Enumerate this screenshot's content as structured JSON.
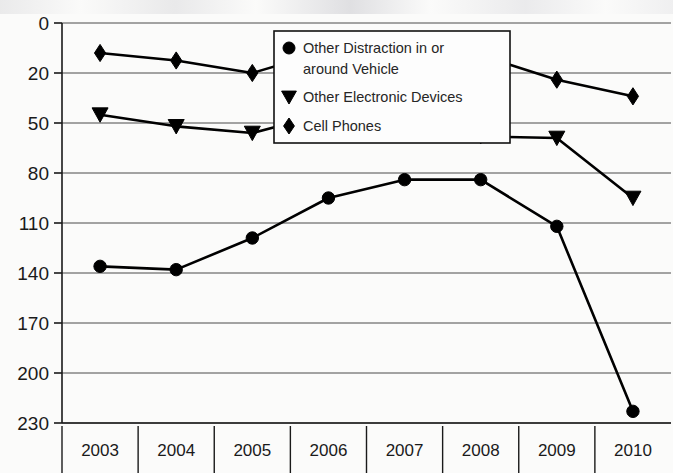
{
  "chart_data": {
    "type": "line",
    "title": "",
    "xlabel": "",
    "ylabel": "",
    "categories": [
      "2003",
      "2004",
      "2005",
      "2006",
      "2007",
      "2008",
      "2009",
      "2010"
    ],
    "ylim": [
      0,
      230
    ],
    "yticks": [
      0,
      20,
      50,
      80,
      110,
      140,
      170,
      200,
      230
    ],
    "ytick_labels": [
      "0",
      "20",
      "50",
      "80",
      "110",
      "140",
      "170",
      "200",
      "230"
    ],
    "grid": true,
    "legend_position": "upper-center",
    "series": [
      {
        "name": "Other Distraction in or around Vehicle",
        "marker": "circle",
        "values": [
          136,
          138,
          119,
          95,
          84,
          84,
          112,
          223
        ]
      },
      {
        "name": "Other Electronic Devices",
        "marker": "triangle",
        "values": [
          45,
          52,
          56,
          44,
          50,
          58,
          59,
          95
        ]
      },
      {
        "name": "Cell Phones",
        "marker": "diamond",
        "values": [
          12,
          15,
          20,
          11,
          14,
          13,
          24,
          34
        ]
      }
    ]
  },
  "legend": {
    "entries": [
      {
        "marker": "circle-marker",
        "label_line1": "Other Distraction in or",
        "label_line2": "around Vehicle"
      },
      {
        "marker": "triangle-marker",
        "label_line1": "Other Electronic Devices",
        "label_line2": ""
      },
      {
        "marker": "diamond-marker",
        "label_line1": "Cell Phones",
        "label_line2": ""
      }
    ]
  },
  "colors": {
    "ink": "#000000",
    "grid": "#4a4a4a",
    "background": "#fbfbfa",
    "legend_background": "#fdfdfd"
  }
}
